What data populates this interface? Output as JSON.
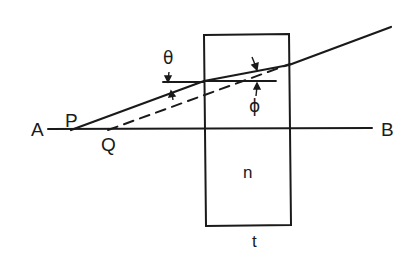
{
  "diagram": {
    "type": "optics-ray-diagram",
    "colors": {
      "ink": "#1a1a1a",
      "background": "#ffffff"
    },
    "labels": {
      "A": "A",
      "B": "B",
      "P": "P",
      "Q": "Q",
      "theta": "θ",
      "phi": "ϕ",
      "n": "n",
      "t": "t"
    },
    "elements": {
      "axis": {
        "from": "A",
        "to": "B"
      },
      "slab": {
        "refractive_index_label": "n",
        "thickness_label": "t"
      },
      "incident_ray": {
        "from": "P",
        "to": "slab-left-face"
      },
      "refracted_ray": {
        "inside": "slab"
      },
      "emergent_ray": {
        "from": "slab-right-face",
        "direction": "up-right"
      },
      "virtual_ray": {
        "style": "dashed",
        "from": "Q"
      },
      "angles": [
        "θ",
        "ϕ"
      ]
    }
  }
}
